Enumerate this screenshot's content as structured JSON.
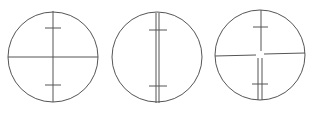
{
  "diagram": {
    "stroke_color": "#555555",
    "background": "#ffffff",
    "reticles": [
      {
        "name": "reticle-single-crosshair",
        "center": [
          53,
          57
        ],
        "radius": 45,
        "vertical": "single",
        "horizontal": "full",
        "ticks_y": [
          28,
          85
        ]
      },
      {
        "name": "reticle-double-vertical",
        "center": [
          157,
          57
        ],
        "radius": 45,
        "vertical": "double",
        "horizontal": "none",
        "ticks_y": [
          30,
          86
        ]
      },
      {
        "name": "reticle-split-crosshair",
        "center": [
          260,
          55
        ],
        "radius": 45,
        "vertical": "single-top-double-bottom",
        "horizontal": "broken-at-center",
        "ticks_y": [
          27,
          84
        ]
      }
    ]
  }
}
